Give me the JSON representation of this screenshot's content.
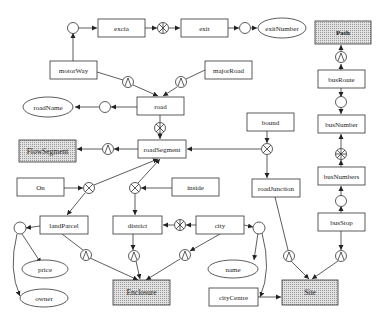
{
  "diagram": {
    "type": "entity-relationship schema",
    "colors": {
      "stroke": "#333333",
      "shaded_fill": "#cfcfcf",
      "background": "#ffffff"
    },
    "entities": {
      "excia": "excia",
      "exit": "exit",
      "exitNumber": "exitNumber",
      "path": "Path",
      "motorWay": "motorWay",
      "majorRoad": "majorRoad",
      "road": "road",
      "roadName": "roadName",
      "roadSegment": "roadSegment",
      "flowSegment": "FlowSegment",
      "bound": "bound",
      "roadJunction": "roadJunction",
      "busRoute": "busRoute",
      "busNumber": "busNumber",
      "busNumbers": "busNumbers",
      "busStop": "busStop",
      "on": "On",
      "inside": "inside",
      "landParcel": "landParcel",
      "district": "district",
      "city": "city",
      "price": "price",
      "owner": "owner",
      "enclosure": "Enclosure",
      "name": "name",
      "cityCentre": "cityCentre",
      "site": "Site"
    },
    "connector_types": [
      "circle",
      "cross-circle",
      "star-circle",
      "lambda-circle"
    ]
  }
}
